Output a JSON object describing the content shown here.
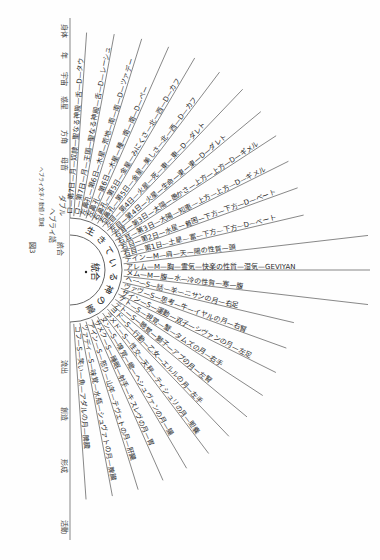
{
  "figure": {
    "caption": "図3",
    "center_label": "統合",
    "ring_label": "生きている神の霊",
    "orientation": "rotated-90"
  },
  "header_columns": {
    "top_group": [
      "身体",
      "年",
      "宇宙",
      "惑星",
      "方角",
      "母音",
      "ヘブライ語のD",
      "ダブル",
      "ヘブライ語"
    ],
    "bottom_group": [
      "活動",
      "形成",
      "創造",
      "流出"
    ],
    "side_note": "ヘブライ文字 / 数値 / 意味"
  },
  "rays": {
    "doubles": [
      {
        "id": 1,
        "text": "ロ—第7日—月—奴隷—聖なる神殿—舌—D—タウ"
      },
      {
        "id": 2,
        "text": "ロ—第7日—月—王国—聖なる神殿—舌—D—レーシュ"
      },
      {
        "id": 3,
        "text": "左鼻孔—第6日—木星—荒地—南—南—D—ツァデー"
      },
      {
        "id": 4,
        "text": "左鼻孔—第6日—木星—種—南—南—D—ペー"
      },
      {
        "id": 5,
        "text": "右鼻孔—第5日—金星—みにくさ—北—西—D—カフ"
      },
      {
        "id": 6,
        "text": "右鼻孔—第5日—金星—美しさ—北—西—D—カフ"
      },
      {
        "id": 7,
        "text": "左目—第4日—火星—死—東—東—D—ダレト"
      },
      {
        "id": 8,
        "text": "左目—第4日—火星—生命—東—東—D—ダレト"
      },
      {
        "id": 9,
        "text": "右耳—第3日—太陽—愚かさ—上方—上方—D—ギメル"
      },
      {
        "id": 10,
        "text": "右耳—第3日—太陽—知恵—上方—上方—D—ギメル"
      },
      {
        "id": 11,
        "text": "右目—第2日—水星—貧困—下方—下方—D—ベート"
      },
      {
        "id": 12,
        "text": "右目—第1日—土星—富—下方—下方—D—ベート"
      }
    ],
    "mothers": [
      {
        "id": 13,
        "text": "デイン—M—肩—天—陽の性質—頭"
      },
      {
        "id": 14,
        "text": "アレム—M—胸—霊気—快楽の性質—湿気—GEVIYAN",
        "latin": "GEVIYAN"
      },
      {
        "id": 15,
        "text": "メム—M—腹—水—冷の性質—寒—腹"
      }
    ],
    "simples": [
      {
        "id": 16,
        "text": "ヘー—S—話—羊—ニサンの月—右足"
      },
      {
        "id": 17,
        "text": "ヴァヴ—S—思考—牛—イヤルの月—右腎"
      },
      {
        "id": 18,
        "text": "ザイン—S—運動—双子—シヴァンの月—左足"
      },
      {
        "id": 19,
        "text": "ケト—S—視覚—蟹—タムズの月—右手"
      },
      {
        "id": 20,
        "text": "テト—S—聴覚—獅子—アブの月—左腎"
      },
      {
        "id": 21,
        "text": "ヨド—S—行動—乙女—エルルの月—左手"
      },
      {
        "id": 22,
        "text": "ラメド—S—性交—天秤—ティシュリの月—胆嚢"
      },
      {
        "id": 23,
        "text": "ヌン—S—嗅覚—蠍—ヘシュヴァンの月—腸"
      },
      {
        "id": 24,
        "text": "サメク—S—睡眠—射手—キスレヴの月—胃"
      },
      {
        "id": 25,
        "text": "アイン—S—怒り—山羊—テヴェトの月—肝臓"
      },
      {
        "id": 26,
        "text": "ツァディ—S—味覚—水瓶—シュヴァトの月—脾臓"
      },
      {
        "id": 27,
        "text": "コフ—S—笑い—魚—アダルの月—脾臓"
      }
    ]
  }
}
